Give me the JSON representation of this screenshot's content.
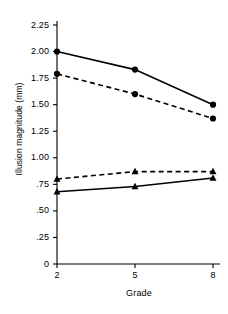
{
  "chart_data": {
    "type": "line",
    "title": "",
    "xlabel": "Grade",
    "ylabel": "Illusion magnitude (mm)",
    "x": [
      2,
      5,
      8
    ],
    "categories": [
      "2",
      "5",
      "8"
    ],
    "xtick_labels": [
      "2",
      "5",
      "8"
    ],
    "ytick_labels": [
      "0",
      ".25",
      ".50",
      ".75",
      "1.00",
      "1.25",
      "1.50",
      "1.75",
      "2.00",
      "2.25"
    ],
    "ytick_values": [
      0,
      0.25,
      0.5,
      0.75,
      1.0,
      1.25,
      1.5,
      1.75,
      2.0,
      2.25
    ],
    "ylim": [
      0,
      2.25
    ],
    "xlim": [
      2,
      8
    ],
    "grid": false,
    "legend": "none",
    "line_color": "#000000",
    "background_color": "#ffffff",
    "series": [
      {
        "name": "circle-solid",
        "marker": "circle",
        "linestyle": "solid",
        "values": [
          2.0,
          1.83,
          1.5
        ]
      },
      {
        "name": "circle-dashed",
        "marker": "circle",
        "linestyle": "dashed",
        "values": [
          1.79,
          1.6,
          1.37
        ]
      },
      {
        "name": "triangle-dashed",
        "marker": "triangle",
        "linestyle": "dashed",
        "values": [
          0.8,
          0.87,
          0.87
        ]
      },
      {
        "name": "triangle-solid",
        "marker": "triangle",
        "linestyle": "solid",
        "values": [
          0.68,
          0.73,
          0.81
        ]
      }
    ]
  }
}
